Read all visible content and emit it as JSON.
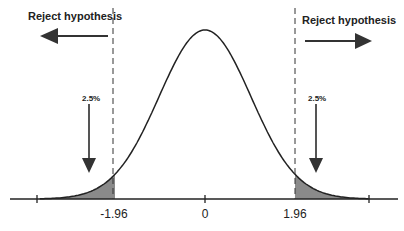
{
  "chart_data": {
    "type": "line",
    "title": "",
    "xlabel": "",
    "ylabel": "",
    "xlim": [
      -3.5,
      3.5
    ],
    "tick_labels": [
      "-1.96",
      "0",
      "1.96"
    ],
    "critical_values": [
      -1.96,
      1.96
    ],
    "shaded_regions": [
      {
        "from": -3.5,
        "to": -1.96,
        "area_pct": "2.5%"
      },
      {
        "from": 1.96,
        "to": 3.5,
        "area_pct": "2.5%"
      }
    ],
    "annotations": {
      "left_region": "Reject hypothesis",
      "right_region": "Reject hypothesis",
      "left_tail": "2.5%",
      "right_tail": "2.5%"
    },
    "grid": false
  },
  "colors": {
    "curve": "#222222",
    "shade": "#8a8a8a",
    "arrow": "#333333"
  }
}
